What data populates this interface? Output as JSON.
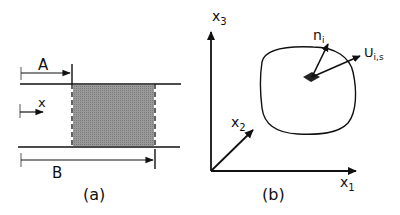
{
  "panel_a": {
    "caption": "(a)",
    "label_A": "A",
    "label_x": "x",
    "label_B": "B",
    "shade_color": "#8f8f8f"
  },
  "panel_b": {
    "caption": "(b)",
    "axis_x1": "x",
    "axis_x1_sub": "1",
    "axis_x2": "x",
    "axis_x2_sub": "2",
    "axis_x3": "x",
    "axis_x3_sub": "3",
    "normal_label": "n",
    "normal_sub": "i",
    "velocity_label": "U",
    "velocity_sub": "i,s"
  }
}
